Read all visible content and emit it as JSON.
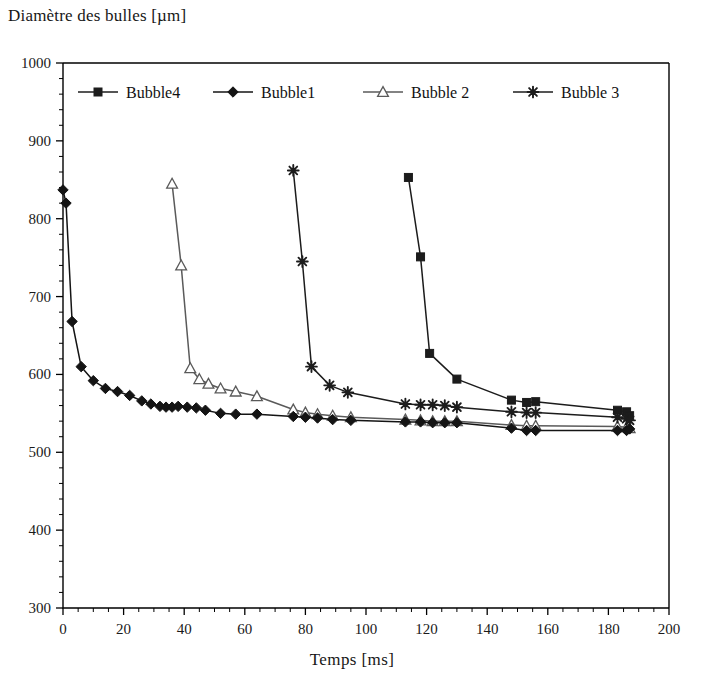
{
  "chart_data": {
    "type": "line",
    "title": "",
    "ylabel": "Diamètre des bulles [µm]",
    "xlabel": "Temps [ms]",
    "xlim": [
      0,
      200
    ],
    "ylim": [
      300,
      1000
    ],
    "x_ticks": [
      0,
      20,
      40,
      60,
      80,
      100,
      120,
      140,
      160,
      180,
      200
    ],
    "y_ticks": [
      300,
      400,
      500,
      600,
      700,
      800,
      900,
      1000
    ],
    "x_minor_step": 5,
    "y_minor_step": 20,
    "grid": false,
    "legend_position": "top-inside",
    "axis_color": "#000000",
    "background_color": "#ffffff",
    "series": [
      {
        "name": "Bubble4",
        "marker": "filled-square",
        "color": "#1c1c1c",
        "points": [
          [
            114,
            853
          ],
          [
            118,
            751
          ],
          [
            121,
            627
          ],
          [
            130,
            594
          ],
          [
            148,
            567
          ],
          [
            153,
            564
          ],
          [
            156,
            565
          ],
          [
            183,
            554
          ],
          [
            186,
            552
          ],
          [
            187,
            547
          ]
        ]
      },
      {
        "name": "Bubble1",
        "marker": "filled-diamond",
        "color": "#141414",
        "points": [
          [
            0,
            837
          ],
          [
            1,
            820
          ],
          [
            3,
            668
          ],
          [
            6,
            610
          ],
          [
            10,
            592
          ],
          [
            14,
            582
          ],
          [
            18,
            578
          ],
          [
            22,
            573
          ],
          [
            26,
            566
          ],
          [
            29,
            562
          ],
          [
            32,
            559
          ],
          [
            34,
            558
          ],
          [
            36,
            558
          ],
          [
            38,
            559
          ],
          [
            41,
            558
          ],
          [
            44,
            557
          ],
          [
            47,
            554
          ],
          [
            52,
            550
          ],
          [
            57,
            549
          ],
          [
            64,
            549
          ],
          [
            76,
            546
          ],
          [
            80,
            545
          ],
          [
            84,
            544
          ],
          [
            89,
            542
          ],
          [
            95,
            541
          ],
          [
            113,
            539
          ],
          [
            118,
            539
          ],
          [
            122,
            538
          ],
          [
            126,
            538
          ],
          [
            130,
            538
          ],
          [
            148,
            531
          ],
          [
            153,
            528
          ],
          [
            156,
            528
          ],
          [
            183,
            528
          ],
          [
            186,
            528
          ],
          [
            187,
            530
          ]
        ]
      },
      {
        "name": "Bubble 2",
        "marker": "open-triangle",
        "color": "#5a5a5a",
        "points": [
          [
            36,
            845
          ],
          [
            39,
            740
          ],
          [
            42,
            608
          ],
          [
            45,
            594
          ],
          [
            48,
            588
          ],
          [
            52,
            582
          ],
          [
            57,
            578
          ],
          [
            64,
            572
          ],
          [
            76,
            555
          ],
          [
            80,
            551
          ],
          [
            84,
            549
          ],
          [
            89,
            547
          ],
          [
            95,
            545
          ],
          [
            113,
            542
          ],
          [
            118,
            541
          ],
          [
            122,
            540
          ],
          [
            126,
            540
          ],
          [
            130,
            540
          ],
          [
            148,
            535
          ],
          [
            153,
            534
          ],
          [
            156,
            534
          ],
          [
            183,
            533
          ],
          [
            186,
            532
          ],
          [
            187,
            531
          ]
        ]
      },
      {
        "name": "Bubble 3",
        "marker": "star",
        "color": "#1c1c1c",
        "points": [
          [
            76,
            862
          ],
          [
            79,
            745
          ],
          [
            82,
            610
          ],
          [
            88,
            586
          ],
          [
            94,
            577
          ],
          [
            113,
            562
          ],
          [
            118,
            561
          ],
          [
            122,
            561
          ],
          [
            126,
            560
          ],
          [
            130,
            558
          ],
          [
            148,
            552
          ],
          [
            153,
            551
          ],
          [
            156,
            551
          ],
          [
            183,
            545
          ],
          [
            186,
            543
          ],
          [
            187,
            541
          ]
        ]
      }
    ]
  },
  "legend": {
    "items": [
      {
        "label": "Bubble4",
        "marker": "filled-square",
        "color": "#1c1c1c"
      },
      {
        "label": "Bubble1",
        "marker": "filled-diamond",
        "color": "#141414"
      },
      {
        "label": "Bubble 2",
        "marker": "open-triangle",
        "color": "#5a5a5a"
      },
      {
        "label": "Bubble 3",
        "marker": "star",
        "color": "#1c1c1c"
      }
    ]
  },
  "axes": {
    "y_title": "Diamètre des bulles [µm]",
    "x_title": "Temps [ms]"
  }
}
